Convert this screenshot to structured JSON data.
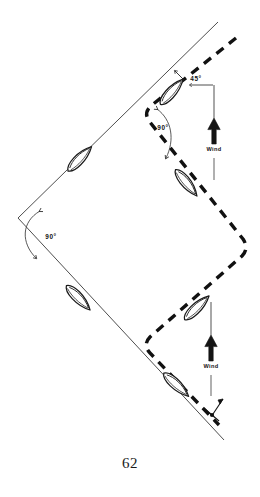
{
  "figure": {
    "page_number": "62",
    "angles": [
      {
        "id": "tack-angle-45",
        "label": "45°",
        "x": 196,
        "y": 81
      },
      {
        "id": "tack-angle-90-upper",
        "label": "90°",
        "x": 162,
        "y": 128
      },
      {
        "id": "tack-angle-90-lower",
        "label": "90°",
        "x": 50,
        "y": 237
      }
    ],
    "wind_arrows": [
      {
        "id": "wind-arrow-upper",
        "label": "Wind",
        "x": 214,
        "y": 143
      },
      {
        "id": "wind-arrow-lower",
        "label": "Wind",
        "x": 211,
        "y": 360
      }
    ],
    "tracks": [
      {
        "id": "solid-track",
        "style": "solid",
        "color": "#333333"
      },
      {
        "id": "dashed-track",
        "style": "dashed",
        "color": "#111111"
      }
    ],
    "boats": [
      {
        "id": "boat-1",
        "x": 172,
        "y": 92
      },
      {
        "id": "boat-2",
        "x": 80,
        "y": 159
      },
      {
        "id": "boat-3",
        "x": 186,
        "y": 183
      },
      {
        "id": "boat-4",
        "x": 78,
        "y": 298
      },
      {
        "id": "boat-5",
        "x": 197,
        "y": 308
      },
      {
        "id": "boat-6",
        "x": 176,
        "y": 385
      }
    ],
    "mark": {
      "id": "buoy-mark",
      "x": 216,
      "y": 408
    }
  }
}
